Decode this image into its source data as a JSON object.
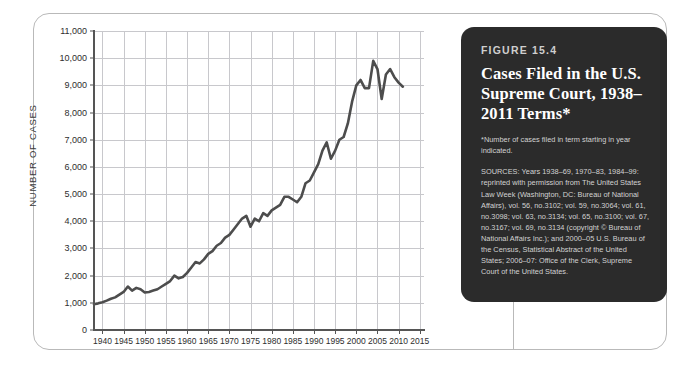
{
  "figure": {
    "number_label": "FIGURE 15.4",
    "title": "Cases Filed in the U.S. Supreme Court, 1938–2011 Terms*",
    "footnote": "*Number of cases filed in term starting in year indicated.",
    "sources": "SOURCES: Years 1938–69, 1970–83, 1984–99: reprinted with permission from The United States Law Week (Washington, DC: Bureau of National Affairs), vol. 56, no.3102; vol. 59, no.3064; vol. 61, no.3098; vol. 63, no.3134; vol. 65, no.3100; vol. 67, no.3167; vol. 69, no.3134 (copyright © Bureau of National Affairs Inc.); and 2000–05 U.S. Bureau of the Census, Statistical Abstract of the United States; 2006–07: Office of the Clerk, Supreme Court of the United States."
  },
  "colors": {
    "caption_background": "#2b2b2b",
    "series_line": "#4d4d4d",
    "gridline": "#c8c8cc",
    "axis": "#555555",
    "page_background": "#ffffff"
  },
  "chart_data": {
    "type": "line",
    "title": "Cases Filed in the U.S. Supreme Court, 1938–2011 Terms",
    "xlabel": "",
    "ylabel": "NUMBER OF CASES",
    "xlim": [
      1938,
      2016
    ],
    "ylim": [
      0,
      11000
    ],
    "ytick_values": [
      0,
      1000,
      2000,
      3000,
      4000,
      5000,
      6000,
      7000,
      8000,
      9000,
      10000,
      11000
    ],
    "ytick_labels": [
      "0",
      "1,000",
      "2,000",
      "3,000",
      "4,000",
      "5,000",
      "6,000",
      "7,000",
      "8,000",
      "9,000",
      "10,000",
      "11,000"
    ],
    "xtick_values": [
      1940,
      1945,
      1950,
      1955,
      1960,
      1965,
      1970,
      1975,
      1980,
      1985,
      1990,
      1995,
      2000,
      2005,
      2010,
      2015
    ],
    "xtick_labels": [
      "1940",
      "1945",
      "1950",
      "1955",
      "1960",
      "1965",
      "1970",
      "1975",
      "1980",
      "1985",
      "1990",
      "1995",
      "2000",
      "2005",
      "2010",
      "2015"
    ],
    "grid": true,
    "legend": "none",
    "series": [
      {
        "name": "Cases filed",
        "x": [
          1938,
          1939,
          1940,
          1941,
          1942,
          1943,
          1944,
          1945,
          1946,
          1947,
          1948,
          1949,
          1950,
          1951,
          1952,
          1953,
          1954,
          1955,
          1956,
          1957,
          1958,
          1959,
          1960,
          1961,
          1962,
          1963,
          1964,
          1965,
          1966,
          1967,
          1968,
          1969,
          1970,
          1971,
          1972,
          1973,
          1974,
          1975,
          1976,
          1977,
          1978,
          1979,
          1980,
          1981,
          1982,
          1983,
          1984,
          1985,
          1986,
          1987,
          1988,
          1989,
          1990,
          1991,
          1992,
          1993,
          1994,
          1995,
          1996,
          1997,
          1998,
          1999,
          2000,
          2001,
          2002,
          2003,
          2004,
          2005,
          2006,
          2007,
          2008,
          2009,
          2010,
          2011
        ],
        "values": [
          950,
          980,
          1020,
          1080,
          1150,
          1200,
          1300,
          1400,
          1600,
          1450,
          1550,
          1500,
          1380,
          1400,
          1450,
          1500,
          1600,
          1700,
          1800,
          2000,
          1900,
          1950,
          2100,
          2300,
          2500,
          2450,
          2600,
          2800,
          2900,
          3100,
          3200,
          3400,
          3500,
          3700,
          3900,
          4100,
          4200,
          3800,
          4100,
          4000,
          4300,
          4200,
          4400,
          4500,
          4600,
          4900,
          4900,
          4800,
          4700,
          4900,
          5400,
          5500,
          5800,
          6100,
          6600,
          6900,
          6300,
          6600,
          7000,
          7100,
          7600,
          8400,
          9000,
          9200,
          8900,
          8900,
          9900,
          9600,
          8500,
          9400,
          9600,
          9300,
          9100,
          8950
        ]
      }
    ]
  }
}
